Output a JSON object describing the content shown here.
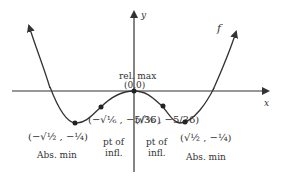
{
  "graph": {
    "function_label": "f",
    "x_axis_label": "x",
    "y_axis_label": "y",
    "points": [
      {
        "id": "rel-max",
        "label": "rel. max",
        "coord": "(0,0)"
      },
      {
        "id": "abs-min-left",
        "coord": "(−√½ , −¼)",
        "label": "Abs. min"
      },
      {
        "id": "infl-left",
        "coord": "(−√⅙ , −5/36)",
        "label_line1": "pt of",
        "label_line2": "infl."
      },
      {
        "id": "infl-right",
        "coord": "(√⅙ , −5/36)",
        "label_line1": "pt of",
        "label_line2": "infl."
      },
      {
        "id": "abs-min-right",
        "coord": "(√½ , −¼)",
        "label": "Abs. min"
      }
    ]
  }
}
